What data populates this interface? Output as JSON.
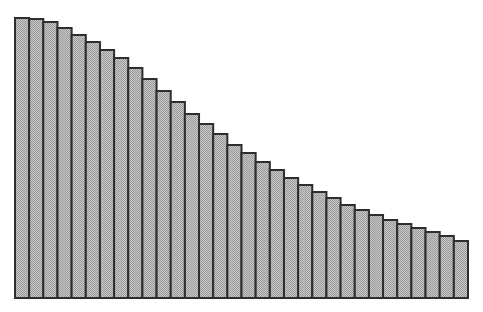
{
  "chart_data": {
    "type": "bar",
    "title": "",
    "xlabel": "",
    "ylabel": "",
    "grid": false,
    "legend": null,
    "bar_count": 32,
    "categories": [
      1,
      2,
      3,
      4,
      5,
      6,
      7,
      8,
      9,
      10,
      11,
      12,
      13,
      14,
      15,
      16,
      17,
      18,
      19,
      20,
      21,
      22,
      23,
      24,
      25,
      26,
      27,
      28,
      29,
      30,
      31,
      32
    ],
    "values": [
      280,
      279,
      276,
      270,
      263,
      256,
      248,
      240,
      230,
      219,
      207,
      196,
      184,
      174,
      164,
      153,
      145,
      136,
      128,
      120,
      113,
      106,
      100,
      93,
      88,
      83,
      78,
      74,
      70,
      66,
      62,
      57
    ],
    "ylim": [
      0,
      280
    ],
    "style": {
      "fill": "#b4b4b4",
      "fill_pattern": "checker",
      "stroke": "#2e2e2e"
    }
  }
}
